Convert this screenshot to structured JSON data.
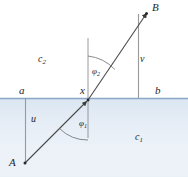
{
  "figure": {
    "points": {
      "A": {
        "label": "A",
        "x": 25,
        "y": 163
      },
      "B": {
        "label": "B",
        "x": 147,
        "y": 13
      },
      "X": {
        "label": "x",
        "x": 88,
        "y": 100
      },
      "a": {
        "label": "a",
        "x": 25,
        "y": 98
      },
      "b": {
        "label": "b",
        "x": 138,
        "y": 98
      }
    },
    "segments": {
      "u": {
        "label": "u",
        "from": "a",
        "to": "A"
      },
      "v": {
        "label": "v",
        "from": "b",
        "to": "B"
      }
    },
    "angles": {
      "phi1": {
        "label": "φ",
        "sub": "1"
      },
      "phi2": {
        "label": "φ",
        "sub": "2"
      }
    },
    "media": {
      "upper": {
        "label": "c",
        "sub": "2"
      },
      "lower": {
        "label": "c",
        "sub": "1"
      }
    },
    "colors": {
      "interface_line": "#8aa6c8",
      "lower_medium_fill": "#e4ecf5",
      "ray": "#4a4a4a",
      "normal_line": "#7a7a7a",
      "drop_line": "#8f8f8f",
      "text": "#262626"
    },
    "geometry": {
      "interface_y": 98,
      "normal_x": 88,
      "normal_top_y": 38,
      "normal_bottom_y": 138,
      "width": 188,
      "height": 177
    }
  }
}
